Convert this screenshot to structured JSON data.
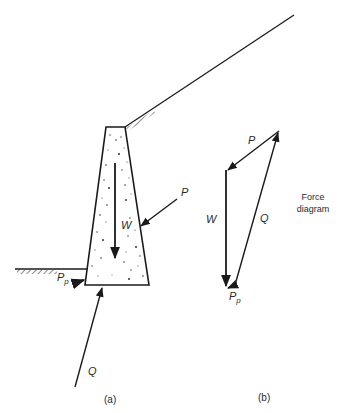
{
  "figure": {
    "panel_a": {
      "caption": "(a)",
      "labels": {
        "weight": "W",
        "active_thrust": "P",
        "passive_main": "P",
        "passive_sub": "p",
        "reaction": "Q"
      }
    },
    "panel_b": {
      "caption": "(b)",
      "title_line1": "Force",
      "title_line2": "diagram",
      "labels": {
        "active_thrust": "P",
        "weight": "W",
        "reaction": "Q",
        "passive_main": "P",
        "passive_sub": "p"
      }
    },
    "colors": {
      "line": "#1a1a1a",
      "text": "#2a2a2a",
      "background": "#ffffff"
    }
  }
}
